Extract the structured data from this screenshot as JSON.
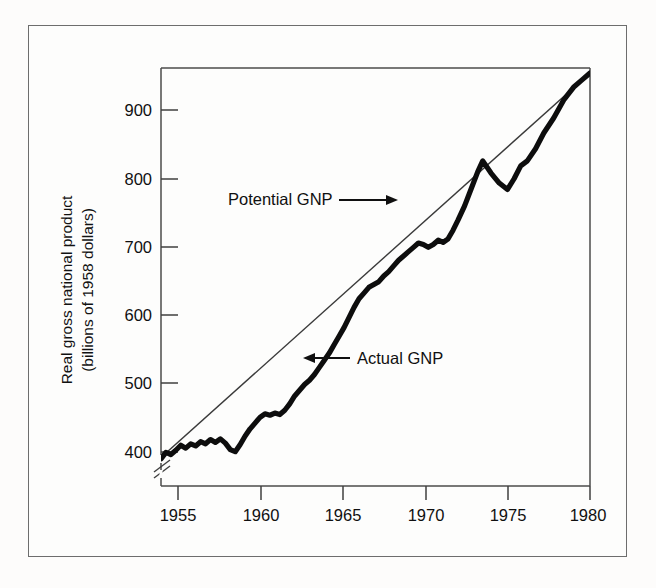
{
  "figure": {
    "background_color": "#fdfcfb",
    "frame_color": "#6d6d6d",
    "ink_color": "#101010"
  },
  "axes": {
    "y_axis_label_line1": "Real gross national product",
    "y_axis_label_line2": "(billions of 1958 dollars)",
    "y_ticks": [
      "400",
      "500",
      "600",
      "700",
      "800",
      "900"
    ],
    "x_ticks": [
      "1955",
      "1960",
      "1965",
      "1970",
      "1975",
      "1980"
    ],
    "axis_break_marker": "axis-break-icon"
  },
  "annotations": [
    {
      "label": "Potential GNP",
      "arrow": "arrow-right-icon"
    },
    {
      "label": "Actual GNP",
      "arrow": "arrow-left-icon"
    }
  ],
  "chart_data": {
    "type": "line",
    "title": "",
    "subtitle": "",
    "xlabel": "",
    "ylabel": "Real gross national product (billions of 1958 dollars)",
    "xlim": [
      1954,
      1980
    ],
    "ylim": [
      390,
      975
    ],
    "grid": false,
    "legend": "inline annotations with arrows",
    "x_tick_values": [
      1955,
      1960,
      1965,
      1970,
      1975,
      1980
    ],
    "y_tick_values": [
      400,
      500,
      600,
      700,
      800,
      900
    ],
    "y_axis_broken_below": 400,
    "series": [
      {
        "name": "Potential GNP",
        "style": "thin straight line",
        "color": "#3a3a3a",
        "width_px": 1.4,
        "x": [
          1954.0,
          1980.0
        ],
        "values": [
          430,
          968
        ]
      },
      {
        "name": "Actual GNP",
        "style": "thick jagged line",
        "color": "#0d0d0d",
        "width_px": 5.2,
        "x": [
          1954.0,
          1954.3,
          1954.6,
          1954.9,
          1955.2,
          1955.5,
          1955.8,
          1956.1,
          1956.4,
          1956.7,
          1957.0,
          1957.3,
          1957.6,
          1957.9,
          1958.2,
          1958.5,
          1958.8,
          1959.1,
          1959.4,
          1959.7,
          1960.0,
          1960.3,
          1960.6,
          1960.9,
          1961.2,
          1961.5,
          1961.8,
          1962.1,
          1962.4,
          1962.7,
          1963.0,
          1963.3,
          1963.6,
          1963.9,
          1964.2,
          1964.5,
          1964.8,
          1965.1,
          1965.4,
          1965.7,
          1966.0,
          1966.3,
          1966.6,
          1966.9,
          1967.2,
          1967.5,
          1967.8,
          1968.1,
          1968.4,
          1968.7,
          1969.0,
          1969.3,
          1969.6,
          1969.9,
          1970.2,
          1970.5,
          1970.8,
          1971.1,
          1971.4,
          1971.7,
          1972.0,
          1972.4,
          1972.8,
          1973.2,
          1973.5,
          1974.0,
          1974.5,
          1975.0,
          1975.4,
          1975.8,
          1976.2,
          1976.7,
          1977.2,
          1977.8,
          1978.4,
          1979.0,
          1979.5,
          1980.0
        ],
        "values": [
          428,
          437,
          434,
          440,
          447,
          443,
          449,
          446,
          452,
          449,
          455,
          451,
          456,
          450,
          441,
          438,
          448,
          460,
          470,
          478,
          486,
          491,
          489,
          492,
          490,
          496,
          505,
          516,
          524,
          532,
          538,
          546,
          556,
          566,
          576,
          588,
          600,
          612,
          626,
          640,
          652,
          660,
          668,
          672,
          676,
          684,
          690,
          698,
          706,
          712,
          718,
          724,
          730,
          728,
          724,
          728,
          734,
          731,
          736,
          748,
          762,
          782,
          806,
          830,
          845,
          828,
          814,
          805,
          820,
          838,
          845,
          862,
          884,
          905,
          930,
          948,
          958,
          968
        ]
      }
    ],
    "notes": [
      "Actual GNP runs below Potential GNP from 1954 through about 1965, converges 1965-1973, peaks above trend about 1973 near 845, falls to a 1975 trough near 805, then rises to meet the potential line near 1979-1980."
    ]
  }
}
